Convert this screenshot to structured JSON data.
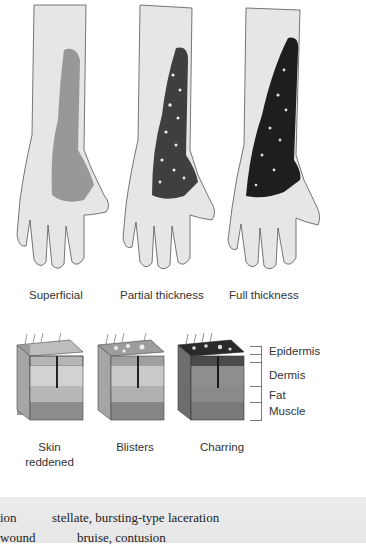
{
  "illustration": {
    "hands": [
      {
        "id": "superficial",
        "label": "Superficial",
        "burn_shade": "#8a8a8a",
        "blister_dots": false
      },
      {
        "id": "partial",
        "label": "Partial thickness",
        "burn_shade": "#3f3f3f",
        "blister_dots": true
      },
      {
        "id": "full",
        "label": "Full thickness",
        "burn_shade": "#1e1e1e",
        "blister_dots": true
      }
    ],
    "skin_blocks": [
      {
        "id": "superficial",
        "result": "Skin reddened"
      },
      {
        "id": "partial",
        "result": "Blisters"
      },
      {
        "id": "full",
        "result": "Charring"
      }
    ],
    "layers": [
      "Epidermis",
      "Dermis",
      "Fat",
      "Muscle"
    ]
  },
  "glossary_band": {
    "rows": [
      {
        "left": "ion",
        "right": "stellate, bursting-type laceration"
      },
      {
        "left": "wound",
        "right": "bruise, contusion"
      }
    ]
  },
  "colors": {
    "band_bg": "#e8e8e8",
    "ink": "#2b2b2b"
  }
}
